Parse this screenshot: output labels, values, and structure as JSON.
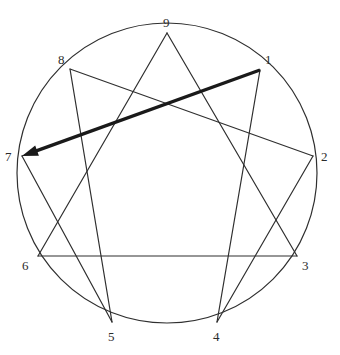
{
  "figure": {
    "name": "enneagram-diagram",
    "title_fragment": "",
    "background_color": "#ffffff",
    "line_color": "#2f2f2f",
    "highlight_color": "#1a1a1a",
    "label_color": "#2b2b2b",
    "circle": {
      "center_x": 167,
      "center_y": 173,
      "radius": 150,
      "stroke_width": 1.2
    }
  },
  "nodes": [
    {
      "label": "1",
      "point_x": 260,
      "point_y": 70,
      "label_x": 265,
      "label_y": 53
    },
    {
      "label": "2",
      "point_x": 313,
      "point_y": 156,
      "label_x": 321,
      "label_y": 150
    },
    {
      "label": "3",
      "point_x": 297,
      "point_y": 256,
      "label_x": 302,
      "label_y": 259
    },
    {
      "label": "4",
      "point_x": 217,
      "point_y": 322,
      "label_x": 213,
      "label_y": 330
    },
    {
      "label": "5",
      "point_x": 112,
      "point_y": 322,
      "label_x": 108,
      "label_y": 330
    },
    {
      "label": "6",
      "point_x": 38,
      "point_y": 256,
      "label_x": 22,
      "label_y": 259
    },
    {
      "label": "7",
      "point_x": 22,
      "point_y": 156,
      "label_x": 5,
      "label_y": 150
    },
    {
      "label": "8",
      "point_x": 70,
      "point_y": 69,
      "label_x": 58,
      "label_y": 53
    },
    {
      "label": "9",
      "point_x": 167,
      "point_y": 33,
      "label_x": 163,
      "label_y": 16
    }
  ],
  "edges": [
    {
      "name": "triangle-9-3",
      "from": "9",
      "to": "3",
      "style": "thin"
    },
    {
      "name": "triangle-3-6",
      "from": "3",
      "to": "6",
      "style": "thin"
    },
    {
      "name": "triangle-6-9",
      "from": "6",
      "to": "9",
      "style": "thin"
    },
    {
      "name": "hexad-1-4",
      "from": "1",
      "to": "4",
      "style": "thin"
    },
    {
      "name": "hexad-4-2",
      "from": "4",
      "to": "2",
      "style": "thin"
    },
    {
      "name": "hexad-2-8",
      "from": "2",
      "to": "8",
      "style": "thin"
    },
    {
      "name": "hexad-8-5",
      "from": "8",
      "to": "5",
      "style": "thin"
    },
    {
      "name": "hexad-5-7",
      "from": "5",
      "to": "7",
      "style": "thin"
    },
    {
      "name": "hexad-7-1",
      "from": "7",
      "to": "1",
      "style": "thin"
    }
  ],
  "arrow": {
    "name": "arrow-1-to-7",
    "from": "1",
    "to": "7",
    "from_x": 260,
    "from_y": 70,
    "to_x": 22,
    "to_y": 156,
    "stroke_width": 3.4,
    "head_length": 16,
    "head_width": 11
  }
}
